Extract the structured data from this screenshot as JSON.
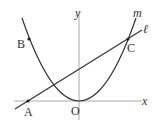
{
  "diagram": {
    "axes": {
      "x_label": "x",
      "y_label": "y",
      "origin_label": "O"
    },
    "curves": [
      {
        "name": "m",
        "type": "parabola",
        "vertex": "O"
      },
      {
        "name": "ℓ",
        "type": "line",
        "through": [
          "A",
          "C"
        ]
      }
    ],
    "points": [
      {
        "label": "A",
        "on": "x-axis and line ℓ"
      },
      {
        "label": "B",
        "on": "parabola m"
      },
      {
        "label": "C",
        "on": "parabola m and line ℓ"
      },
      {
        "label": "O",
        "on": "origin"
      }
    ],
    "colors": {
      "stroke": "#333333",
      "axis": "#aaaaaa"
    }
  }
}
